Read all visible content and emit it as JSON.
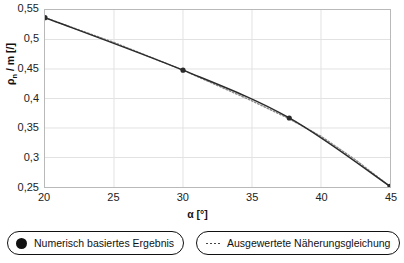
{
  "chart_data": {
    "type": "line",
    "title": "",
    "xlabel": "α [°]",
    "ylabel": "ρ_n / m [/]",
    "ylabel_base": "ρ",
    "ylabel_sub": "n",
    "ylabel_rest": " / m [/]",
    "xlim": [
      20,
      45
    ],
    "ylim": [
      0.25,
      0.55
    ],
    "grid": true,
    "legend_position": "bottom",
    "xticks": [
      20,
      25,
      30,
      35,
      40,
      45
    ],
    "xtick_labels": [
      "20",
      "25",
      "30",
      "35",
      "40",
      "45"
    ],
    "yticks": [
      0.25,
      0.3,
      0.35,
      0.4,
      0.45,
      0.5,
      0.55
    ],
    "ytick_labels": [
      "0,25",
      "0,3",
      "0,35",
      "0,4",
      "0,45",
      "0,5",
      "0,55"
    ],
    "series": [
      {
        "name": "Numerisch basiertes Ergebnis",
        "marker": "filled-circle",
        "linestyle": "solid",
        "color": "#2b2b2b",
        "x": [
          20,
          30,
          37.7,
          45
        ],
        "values": [
          0.537,
          0.448,
          0.367,
          0.251
        ]
      },
      {
        "name": "Ausgewertete Näherungsgleichung",
        "marker": "none",
        "linestyle": "dotted",
        "color": "#8a8a8a",
        "x": [
          20,
          25,
          30,
          32.5,
          35,
          37.5,
          40,
          42.5,
          45
        ],
        "values": [
          0.537,
          0.495,
          0.448,
          0.422,
          0.396,
          0.368,
          0.336,
          0.296,
          0.251
        ]
      }
    ]
  },
  "axes": {
    "x_label": "α [°]",
    "y_label_main": "ρ",
    "y_label_sub": "n",
    "y_label_tail": " / m [/]"
  },
  "legend": {
    "items": [
      {
        "label": "Numerisch basiertes Ergebnis",
        "marker": "filled-circle"
      },
      {
        "label": "Ausgewertete Näherungsgleichung",
        "marker": "dotted-line"
      }
    ]
  },
  "colors": {
    "line_numeric": "#2b2b2b",
    "line_approx": "#8a8a8a",
    "grid": "#e2e2e2",
    "frame": "#b9b9b9",
    "text": "#111111"
  }
}
